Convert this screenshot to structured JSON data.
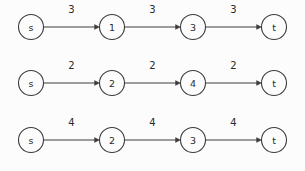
{
  "diagram": {
    "title": "",
    "type": "directed-weighted-path-graphs",
    "style": {
      "background_color": "#fcfcfc",
      "stroke_color": "#3c3c3c",
      "text_color": "#2b2b2b",
      "node_radius": 12.5
    },
    "layout": {
      "node_x_positions": [
        31,
        112,
        193,
        274
      ],
      "row_y_positions": [
        27,
        83,
        140
      ],
      "weight_label_offset_y": -19
    },
    "rows": [
      {
        "id": "row-1",
        "nodes": [
          {
            "id": "n1-0",
            "label": "s"
          },
          {
            "id": "n1-1",
            "label": "1"
          },
          {
            "id": "n1-2",
            "label": "3"
          },
          {
            "id": "n1-3",
            "label": "t"
          }
        ],
        "edges": [
          {
            "from": "s",
            "to": "1",
            "weight": "3"
          },
          {
            "from": "1",
            "to": "3",
            "weight": "3"
          },
          {
            "from": "3",
            "to": "t",
            "weight": "3"
          }
        ]
      },
      {
        "id": "row-2",
        "nodes": [
          {
            "id": "n2-0",
            "label": "s"
          },
          {
            "id": "n2-1",
            "label": "2"
          },
          {
            "id": "n2-2",
            "label": "4"
          },
          {
            "id": "n2-3",
            "label": "t"
          }
        ],
        "edges": [
          {
            "from": "s",
            "to": "2",
            "weight": "2"
          },
          {
            "from": "2",
            "to": "4",
            "weight": "2"
          },
          {
            "from": "4",
            "to": "t",
            "weight": "2"
          }
        ]
      },
      {
        "id": "row-3",
        "nodes": [
          {
            "id": "n3-0",
            "label": "s"
          },
          {
            "id": "n3-1",
            "label": "2"
          },
          {
            "id": "n3-2",
            "label": "3"
          },
          {
            "id": "n3-3",
            "label": "t"
          }
        ],
        "edges": [
          {
            "from": "s",
            "to": "2",
            "weight": "4"
          },
          {
            "from": "2",
            "to": "3",
            "weight": "4"
          },
          {
            "from": "3",
            "to": "t",
            "weight": "4"
          }
        ]
      }
    ]
  }
}
